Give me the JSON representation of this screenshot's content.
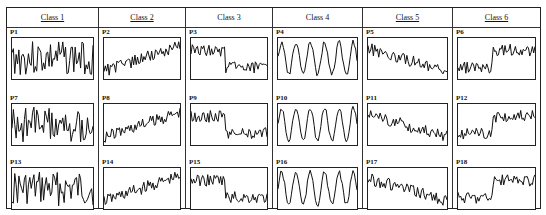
{
  "figure": {
    "classes": [
      {
        "label": "Class 1",
        "underlined": true,
        "panels": [
          "P1",
          "P7",
          "P13"
        ],
        "pattern": "random-noise"
      },
      {
        "label": "Class 2",
        "underlined": true,
        "panels": [
          "P2",
          "P8",
          "P14"
        ],
        "pattern": "upward-trend"
      },
      {
        "label": "Class 3",
        "underlined": false,
        "panels": [
          "P3",
          "P9",
          "P15"
        ],
        "pattern": "downward-shift"
      },
      {
        "label": "Class 4",
        "underlined": false,
        "panels": [
          "P4",
          "P10",
          "P16"
        ],
        "pattern": "cyclic"
      },
      {
        "label": "Class 5",
        "underlined": true,
        "panels": [
          "P5",
          "P11",
          "P17"
        ],
        "pattern": "downward-trend"
      },
      {
        "label": "Class 6",
        "underlined": true,
        "panels": [
          "P6",
          "P12",
          "P18"
        ],
        "pattern": "upward-shift"
      }
    ],
    "colors": {
      "line": "#111111",
      "border": "#222222",
      "background": "#ffffff"
    }
  }
}
